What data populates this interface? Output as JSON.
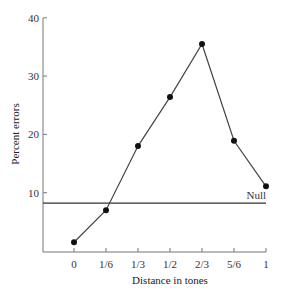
{
  "chart_data": {
    "type": "line",
    "title": "",
    "xlabel": "Distance in tones",
    "ylabel": "Percent errors",
    "categories": [
      "0",
      "1/6",
      "1/3",
      "1/2",
      "2/3",
      "5/6",
      "1"
    ],
    "x": [
      0,
      0.1667,
      0.3333,
      0.5,
      0.6667,
      0.8333,
      1
    ],
    "values": [
      1.5,
      7.0,
      18.0,
      26.4,
      35.5,
      18.9,
      11.1
    ],
    "ylim": [
      0,
      40
    ],
    "yticks": [
      10,
      20,
      30,
      40
    ],
    "grid": false,
    "annotations": [
      {
        "type": "hline",
        "y": 8.2,
        "label": "Null"
      }
    ],
    "colors": {
      "line": "#444444",
      "marker": "#111111",
      "axis": "#777777"
    }
  }
}
